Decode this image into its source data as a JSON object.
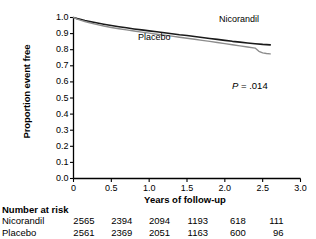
{
  "chart_data": {
    "type": "line",
    "title": "",
    "xlabel": "Years of follow-up",
    "ylabel": "Proportion event free",
    "xlim": [
      0,
      3.0
    ],
    "ylim": [
      0,
      1.0
    ],
    "xticks": [
      "0",
      "0.5",
      "1.0",
      "1.5",
      "2.0",
      "2.5",
      "3.0"
    ],
    "xtick_values": [
      0,
      0.5,
      1.0,
      1.5,
      2.0,
      2.5,
      3.0
    ],
    "yticks": [
      "0.0",
      "0.1",
      "0.2",
      "0.3",
      "0.4",
      "0.5",
      "0.6",
      "0.7",
      "0.8",
      "0.9",
      "1.0"
    ],
    "ytick_values": [
      0.0,
      0.1,
      0.2,
      0.3,
      0.4,
      0.5,
      0.6,
      0.7,
      0.8,
      0.9,
      1.0
    ],
    "grid": false,
    "legend_position": "inline-annotations",
    "annotations": [
      {
        "name": "p-value",
        "text": "P = .014",
        "x": 2.35,
        "y": 0.52
      }
    ],
    "series": [
      {
        "name": "Nicorandil",
        "color": "#1a1a1a",
        "label_x": 2.25,
        "label_y": 0.905,
        "x": [
          0.0,
          0.05,
          0.1,
          0.15,
          0.2,
          0.3,
          0.4,
          0.5,
          0.6,
          0.7,
          0.8,
          0.9,
          1.0,
          1.1,
          1.2,
          1.3,
          1.4,
          1.5,
          1.6,
          1.7,
          1.8,
          1.9,
          2.0,
          2.1,
          2.2,
          2.3,
          2.4,
          2.5,
          2.6
        ],
        "y": [
          1.0,
          0.993,
          0.987,
          0.981,
          0.976,
          0.967,
          0.958,
          0.95,
          0.943,
          0.936,
          0.929,
          0.923,
          0.917,
          0.911,
          0.905,
          0.899,
          0.893,
          0.888,
          0.882,
          0.876,
          0.87,
          0.864,
          0.858,
          0.852,
          0.847,
          0.842,
          0.837,
          0.833,
          0.83
        ]
      },
      {
        "name": "Placebo",
        "color": "#8c8c8c",
        "label_x": 1.05,
        "label_y": 0.825,
        "x": [
          0.0,
          0.05,
          0.1,
          0.15,
          0.2,
          0.3,
          0.4,
          0.5,
          0.6,
          0.7,
          0.8,
          0.9,
          1.0,
          1.1,
          1.2,
          1.3,
          1.4,
          1.5,
          1.6,
          1.7,
          1.8,
          1.9,
          2.0,
          2.1,
          2.2,
          2.3,
          2.4,
          2.45,
          2.5,
          2.55,
          2.6
        ],
        "y": [
          1.0,
          0.99,
          0.982,
          0.975,
          0.969,
          0.957,
          0.947,
          0.938,
          0.93,
          0.923,
          0.916,
          0.909,
          0.903,
          0.896,
          0.89,
          0.884,
          0.877,
          0.871,
          0.865,
          0.858,
          0.852,
          0.845,
          0.838,
          0.831,
          0.824,
          0.817,
          0.81,
          0.79,
          0.78,
          0.776,
          0.774
        ]
      }
    ],
    "risk_table": {
      "title": "Number at risk",
      "columns": [
        0,
        0.5,
        1.0,
        1.5,
        2.0,
        2.5,
        3.0
      ],
      "rows": [
        {
          "label": "Nicorandil",
          "values": [
            "2565",
            "2394",
            "2094",
            "1193",
            "618",
            "111",
            "0"
          ]
        },
        {
          "label": "Placebo",
          "values": [
            "2561",
            "2369",
            "2051",
            "1163",
            "600",
            "96",
            "0"
          ]
        }
      ]
    }
  }
}
